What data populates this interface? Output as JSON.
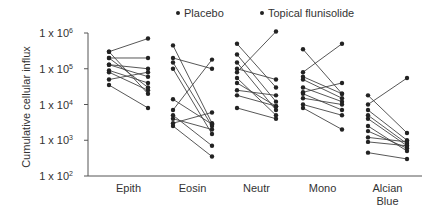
{
  "chart_data": {
    "type": "line",
    "title": "",
    "xlabel": "",
    "ylabel": "Cumulative cellular influx",
    "yscale": "log",
    "ylim": [
      100,
      1000000
    ],
    "yticks": [
      {
        "value": 1000000,
        "base": "1 x 10",
        "exp": "6"
      },
      {
        "value": 100000,
        "base": "1 x 10",
        "exp": "5"
      },
      {
        "value": 10000,
        "base": "1 x 10",
        "exp": "4"
      },
      {
        "value": 1000,
        "base": "1 x 10",
        "exp": "3"
      },
      {
        "value": 100,
        "base": "1 x 10",
        "exp": "2"
      }
    ],
    "legend": {
      "position": "top",
      "entries": [
        "Placebo",
        "Topical flunisolide"
      ]
    },
    "grid": false,
    "categories": [
      {
        "name": "Epith",
        "lines": [
          "Epith"
        ]
      },
      {
        "name": "Eosin",
        "lines": [
          "Eosin"
        ]
      },
      {
        "name": "Neutr",
        "lines": [
          "Neutr"
        ]
      },
      {
        "name": "Mono",
        "lines": [
          "Mono"
        ]
      },
      {
        "name": "Alcian Blue",
        "lines": [
          "Alcian",
          "Blue"
        ]
      }
    ],
    "series_description": "Paired values per subject: [placebo, topical flunisolide]",
    "groups": [
      {
        "category": "Epith",
        "pairs": [
          [
            300000,
            20000
          ],
          [
            300000,
            700000
          ],
          [
            200000,
            200000
          ],
          [
            200000,
            30000
          ],
          [
            130000,
            100000
          ],
          [
            130000,
            60000
          ],
          [
            90000,
            40000
          ],
          [
            80000,
            25000
          ],
          [
            50000,
            80000
          ],
          [
            35000,
            8000
          ]
        ]
      },
      {
        "category": "Eosin",
        "pairs": [
          [
            450000,
            3000
          ],
          [
            200000,
            100000
          ],
          [
            150000,
            2500
          ],
          [
            100000,
            1500
          ],
          [
            14000,
            2800
          ],
          [
            7000,
            180000
          ],
          [
            5000,
            700
          ],
          [
            4000,
            2000
          ],
          [
            3000,
            6000
          ],
          [
            2500,
            350
          ]
        ]
      },
      {
        "category": "Neutr",
        "pairs": [
          [
            500000,
            30000
          ],
          [
            250000,
            12000
          ],
          [
            150000,
            7000
          ],
          [
            100000,
            50000
          ],
          [
            80000,
            1100000
          ],
          [
            55000,
            5000
          ],
          [
            40000,
            9000
          ],
          [
            25000,
            18000
          ],
          [
            18000,
            9000
          ],
          [
            8000,
            4000
          ]
        ]
      },
      {
        "category": "Mono",
        "pairs": [
          [
            350000,
            20000
          ],
          [
            80000,
            500000
          ],
          [
            60000,
            20000
          ],
          [
            50000,
            15000
          ],
          [
            30000,
            12000
          ],
          [
            22000,
            40000
          ],
          [
            20000,
            7000
          ],
          [
            15000,
            10000
          ],
          [
            10000,
            5000
          ],
          [
            8000,
            2000
          ]
        ]
      },
      {
        "category": "Alcian Blue",
        "pairs": [
          [
            18000,
            1600
          ],
          [
            10000,
            55000
          ],
          [
            7000,
            1000
          ],
          [
            5000,
            800
          ],
          [
            4000,
            700
          ],
          [
            2500,
            500
          ],
          [
            1800,
            600
          ],
          [
            1200,
            900
          ],
          [
            900,
            700
          ],
          [
            450,
            300
          ]
        ]
      }
    ]
  }
}
